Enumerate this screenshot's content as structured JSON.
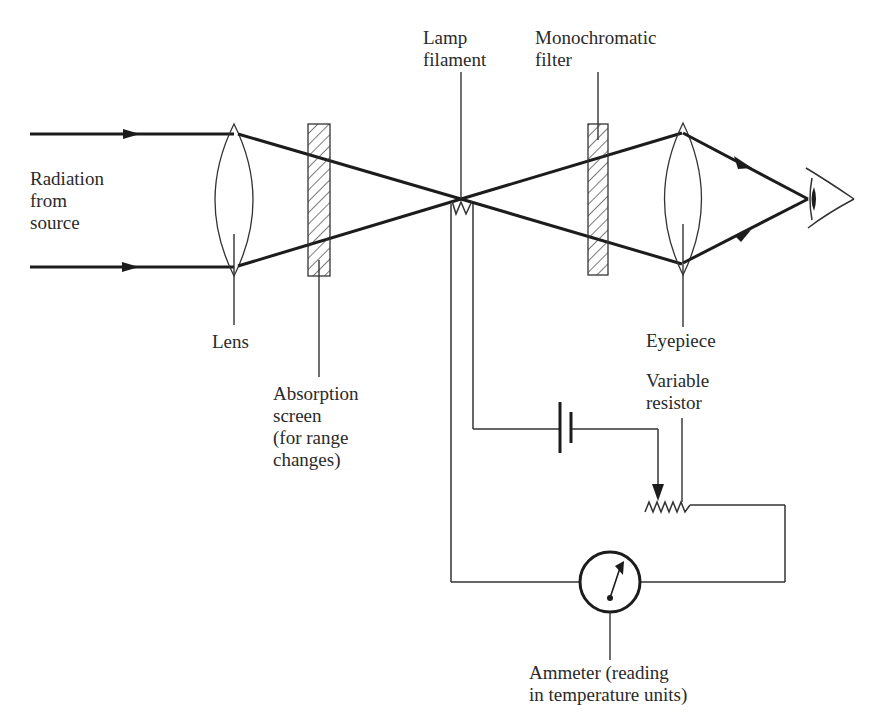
{
  "figure": {
    "labels": {
      "radiation": [
        "Radiation",
        "from",
        "source"
      ],
      "lens": "Lens",
      "absorption": [
        "Absorption",
        "screen",
        "(for range",
        "changes)"
      ],
      "lamp": [
        "Lamp",
        "filament"
      ],
      "filter": [
        "Monochromatic",
        "filter"
      ],
      "eyepiece": "Eyepiece",
      "resistor": [
        "Variable",
        "resistor"
      ],
      "ammeter": [
        "Ammeter (reading",
        "in temperature units)"
      ]
    },
    "components": [
      "incoming-radiation-rays",
      "objective-lens",
      "absorption-screen",
      "lamp-filament",
      "monochromatic-filter",
      "eyepiece-lens",
      "observer-eye",
      "battery",
      "variable-resistor",
      "ammeter"
    ],
    "colors": {
      "ink": "#1c1c1c",
      "background": "#ffffff"
    }
  }
}
